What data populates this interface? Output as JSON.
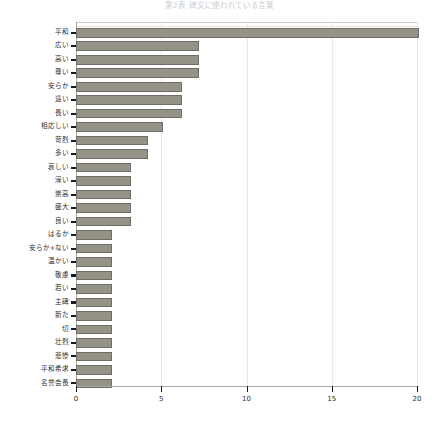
{
  "chart_data": {
    "type": "bar",
    "orientation": "horizontal",
    "title": "第2表 碑文に使われている言葉",
    "xlabel": "",
    "ylabel": "",
    "xlim": [
      0,
      20
    ],
    "xticks": [
      0,
      5,
      10,
      15,
      20
    ],
    "xtick_labels": [
      "0",
      "5",
      "10",
      "15",
      "20"
    ],
    "grid": true,
    "grid_axis": "x",
    "legend": false,
    "bar_color": "#959288",
    "bar_edge_color": "#6f6d65",
    "grid_color": "#eceade",
    "axis_color": "#a9a69a",
    "categories": [
      "平和",
      "広い",
      "高い",
      "尊い",
      "安らか",
      "遠い",
      "長い",
      "相応しい",
      "苛烈",
      "多い",
      "哀しい",
      "深い",
      "崇高",
      "盛大",
      "良い",
      "はるか",
      "安らか+ない",
      "温かい",
      "敬虔",
      "若い",
      "主碑",
      "新た",
      "切",
      "壮烈",
      "悲惨",
      "平和希求",
      "名誉会長"
    ],
    "values": [
      20.1,
      7.2,
      7.2,
      7.2,
      6.2,
      6.2,
      6.2,
      5.1,
      4.2,
      4.2,
      3.2,
      3.2,
      3.2,
      3.2,
      3.2,
      2.1,
      2.1,
      2.1,
      2.1,
      2.1,
      2.1,
      2.1,
      2.1,
      2.1,
      2.1,
      2.1,
      2.1
    ]
  }
}
